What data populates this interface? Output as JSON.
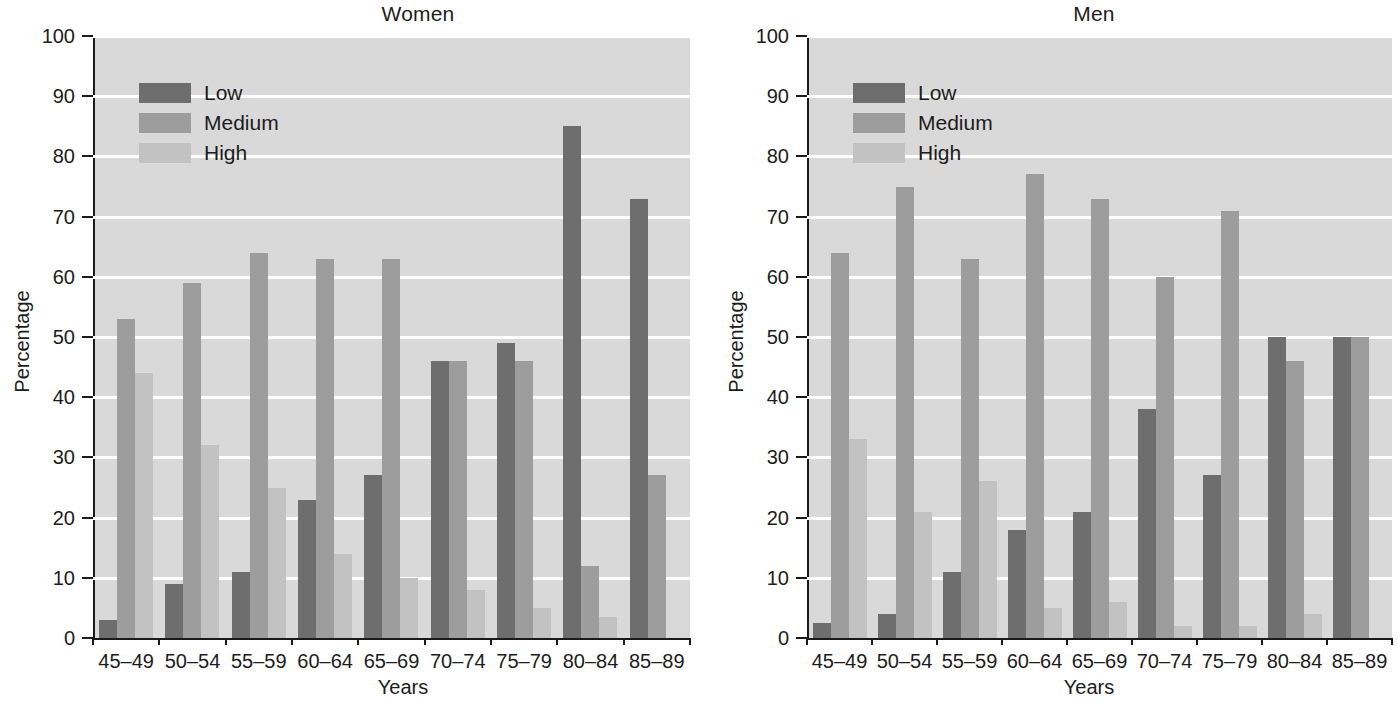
{
  "chart_data": [
    {
      "type": "bar",
      "title": "Women",
      "xlabel": "Years",
      "ylabel": "Percentage",
      "ylim": [
        0,
        100
      ],
      "ytick_step": 10,
      "yticks": [
        0,
        10,
        20,
        30,
        40,
        50,
        60,
        70,
        80,
        90,
        100
      ],
      "grid": true,
      "grid_axis": "y",
      "legend_position": "upper left",
      "categories": [
        "45–49",
        "50–54",
        "55–59",
        "60–64",
        "65–69",
        "70–74",
        "75–79",
        "80–84",
        "85–89"
      ],
      "series": [
        {
          "name": "Low",
          "color": "#6e6e6e",
          "values": [
            3,
            9,
            11,
            23,
            27,
            46,
            49,
            85,
            73
          ]
        },
        {
          "name": "Medium",
          "color": "#9d9d9d",
          "values": [
            53,
            59,
            64,
            63,
            63,
            46,
            46,
            12,
            27
          ]
        },
        {
          "name": "High",
          "color": "#c2c2c2",
          "values": [
            44,
            32,
            25,
            14,
            10,
            8,
            5,
            3.5,
            0
          ]
        }
      ]
    },
    {
      "type": "bar",
      "title": "Men",
      "xlabel": "Years",
      "ylabel": "Percentage",
      "ylim": [
        0,
        100
      ],
      "ytick_step": 10,
      "yticks": [
        0,
        10,
        20,
        30,
        40,
        50,
        60,
        70,
        80,
        90,
        100
      ],
      "grid": true,
      "grid_axis": "y",
      "legend_position": "upper left",
      "categories": [
        "45–49",
        "50–54",
        "55–59",
        "60–64",
        "65–69",
        "70–74",
        "75–79",
        "80–84",
        "85–89"
      ],
      "series": [
        {
          "name": "Low",
          "color": "#6e6e6e",
          "values": [
            2.5,
            4,
            11,
            18,
            21,
            38,
            27,
            50,
            50
          ]
        },
        {
          "name": "Medium",
          "color": "#9d9d9d",
          "values": [
            64,
            75,
            63,
            77,
            73,
            60,
            71,
            46,
            50
          ]
        },
        {
          "name": "High",
          "color": "#c2c2c2",
          "values": [
            33,
            21,
            26,
            5,
            6,
            2,
            2,
            4,
            0
          ]
        }
      ]
    }
  ],
  "colors": {
    "plot_background": "#d9d9d9",
    "gridline": "#ffffff",
    "axis": "#1a1a1a",
    "low": "#6e6e6e",
    "medium": "#9d9d9d",
    "high": "#c2c2c2"
  }
}
